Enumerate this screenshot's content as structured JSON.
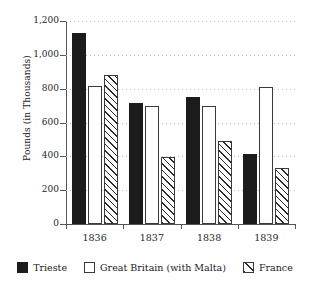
{
  "chart_data": {
    "type": "bar",
    "title": "",
    "xlabel": "",
    "ylabel": "Pounds (in Thousands)",
    "categories": [
      "1836",
      "1837",
      "1838",
      "1839"
    ],
    "series": [
      {
        "name": "Trieste",
        "values": [
          1130,
          715,
          750,
          415
        ]
      },
      {
        "name": "Great Britain (with Malta)",
        "values": [
          815,
          700,
          700,
          810
        ]
      },
      {
        "name": "France",
        "values": [
          880,
          395,
          490,
          330
        ]
      }
    ],
    "ylim": [
      0,
      1200
    ],
    "ytick_values": [
      0,
      200,
      400,
      600,
      800,
      1000,
      1200
    ],
    "ytick_labels": [
      "0",
      "200",
      "400",
      "600",
      "800",
      "1,000",
      "1,200"
    ],
    "grid": "horizontal-dotted",
    "legend_position": "bottom",
    "colors": {
      "trieste": "#1c1c1c",
      "great_britain": "#ffffff",
      "france_hatch": "#2a2a2a",
      "axis": "#555555",
      "gridline": "#bdbdbd"
    }
  },
  "legend": {
    "entries": [
      {
        "label": "Trieste",
        "style": "solid-black-swatch"
      },
      {
        "label": "Great Britain (with Malta)",
        "style": "empty-white-swatch"
      },
      {
        "label": "France",
        "style": "diagonal-hatch-swatch"
      }
    ]
  }
}
